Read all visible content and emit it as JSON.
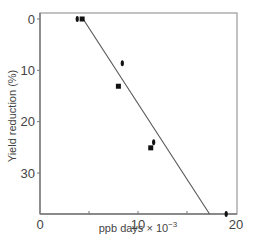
{
  "chart_data": {
    "type": "scatter",
    "title": "",
    "xlabel": "ppb days × 10",
    "xlabel_exponent": "−3",
    "ylabel": "Yield reduction (%)",
    "xlim": [
      0,
      20
    ],
    "ylim": [
      0,
      38
    ],
    "y_inverted": true,
    "grid": false,
    "legend": null,
    "x_ticks": [
      0,
      5,
      10,
      15,
      20
    ],
    "x_tick_labels": [
      "0",
      "",
      "10",
      "",
      "20"
    ],
    "y_ticks": [
      0,
      10,
      20,
      30
    ],
    "y_tick_labels": [
      "0",
      "10",
      "20",
      "30"
    ],
    "series": [
      {
        "name": "observations",
        "points": [
          {
            "x": 3.8,
            "y": 0,
            "marker": "ellipse"
          },
          {
            "x": 4.3,
            "y": 0,
            "marker": "square"
          },
          {
            "x": 8.4,
            "y": 8.6,
            "marker": "ellipse"
          },
          {
            "x": 8.0,
            "y": 13.1,
            "marker": "square"
          },
          {
            "x": 11.6,
            "y": 24.0,
            "marker": "ellipse"
          },
          {
            "x": 11.3,
            "y": 25.1,
            "marker": "square"
          },
          {
            "x": 19.0,
            "y": 38.0,
            "marker": "ellipse"
          }
        ]
      },
      {
        "name": "regression line",
        "type": "line",
        "points": [
          {
            "x": 4.4,
            "y": 0
          },
          {
            "x": 17.3,
            "y": 38
          }
        ]
      }
    ]
  },
  "colors": {
    "axis": "#777777",
    "frame": "#999999",
    "marker": "#111111",
    "line": "#555555"
  }
}
